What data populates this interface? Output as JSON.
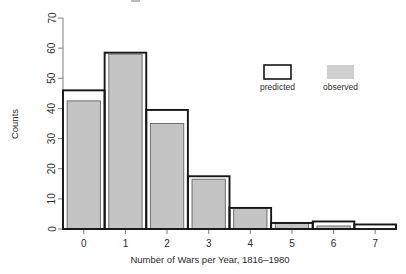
{
  "chart_data": {
    "type": "bar",
    "title": "",
    "xlabel": "Number of Wars per Year, 1816–1980",
    "ylabel": "Counts",
    "categories": [
      "0",
      "1",
      "2",
      "3",
      "4",
      "5",
      "6",
      "7"
    ],
    "x": [
      0,
      1,
      2,
      3,
      4,
      5,
      6,
      7
    ],
    "series": [
      {
        "name": "predicted",
        "style": "outline",
        "color": "#161616",
        "values": [
          46,
          58.5,
          39.5,
          17.5,
          7,
          2,
          2.5,
          1.5
        ]
      },
      {
        "name": "observed",
        "style": "filled",
        "color": "#c4c4c4",
        "values": [
          42.5,
          58,
          35,
          16.5,
          7,
          2,
          1,
          0
        ]
      }
    ],
    "ylim": [
      0,
      70
    ],
    "yticks": [
      0,
      10,
      20,
      30,
      40,
      50,
      60,
      70
    ],
    "ytick_labels": [
      "0",
      "10",
      "20",
      "30",
      "40",
      "50",
      "60",
      "70"
    ],
    "xticks": [
      0,
      1,
      2,
      3,
      4,
      5,
      6,
      7
    ],
    "xtick_labels": [
      "0",
      "1",
      "2",
      "3",
      "4",
      "5",
      "6",
      "7"
    ],
    "xlim": [
      -0.5,
      7.5
    ],
    "grid": false,
    "legend_position": "top-right"
  },
  "legend": {
    "entries": [
      {
        "label": "predicted",
        "swatch": "outlined-box"
      },
      {
        "label": "observed",
        "swatch": "filled-gray-box"
      }
    ]
  },
  "axes": {
    "y_title": "Counts",
    "x_title": "Number of Wars per Year, 1816–1980"
  },
  "colors": {
    "observed_fill": "#c4c4c4",
    "observed_stroke": "#6f6f6f",
    "predicted_stroke": "#161616",
    "axis": "#8a8a8a",
    "text": "#2b2b2b",
    "background": "#ffffff"
  }
}
